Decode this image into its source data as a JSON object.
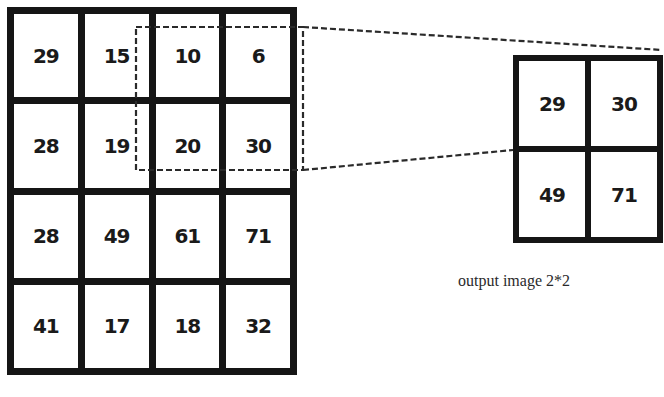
{
  "diagram": {
    "type": "max-pooling illustration",
    "input_grid": {
      "rows": 4,
      "cols": 4,
      "values": [
        [
          "29",
          "15",
          "10",
          "6"
        ],
        [
          "28",
          "19",
          "20",
          "30"
        ],
        [
          "28",
          "49",
          "61",
          "71"
        ],
        [
          "41",
          "17",
          "18",
          "32"
        ]
      ]
    },
    "output_grid": {
      "rows": 2,
      "cols": 2,
      "values": [
        [
          "29",
          "30"
        ],
        [
          "49",
          "71"
        ]
      ]
    },
    "caption": "output image 2*2",
    "colors": {
      "grid_border": "#151515",
      "cell_bg": "#ffffff",
      "text": "#1a1a1a",
      "dashed_line": "#2a2a2a"
    }
  }
}
